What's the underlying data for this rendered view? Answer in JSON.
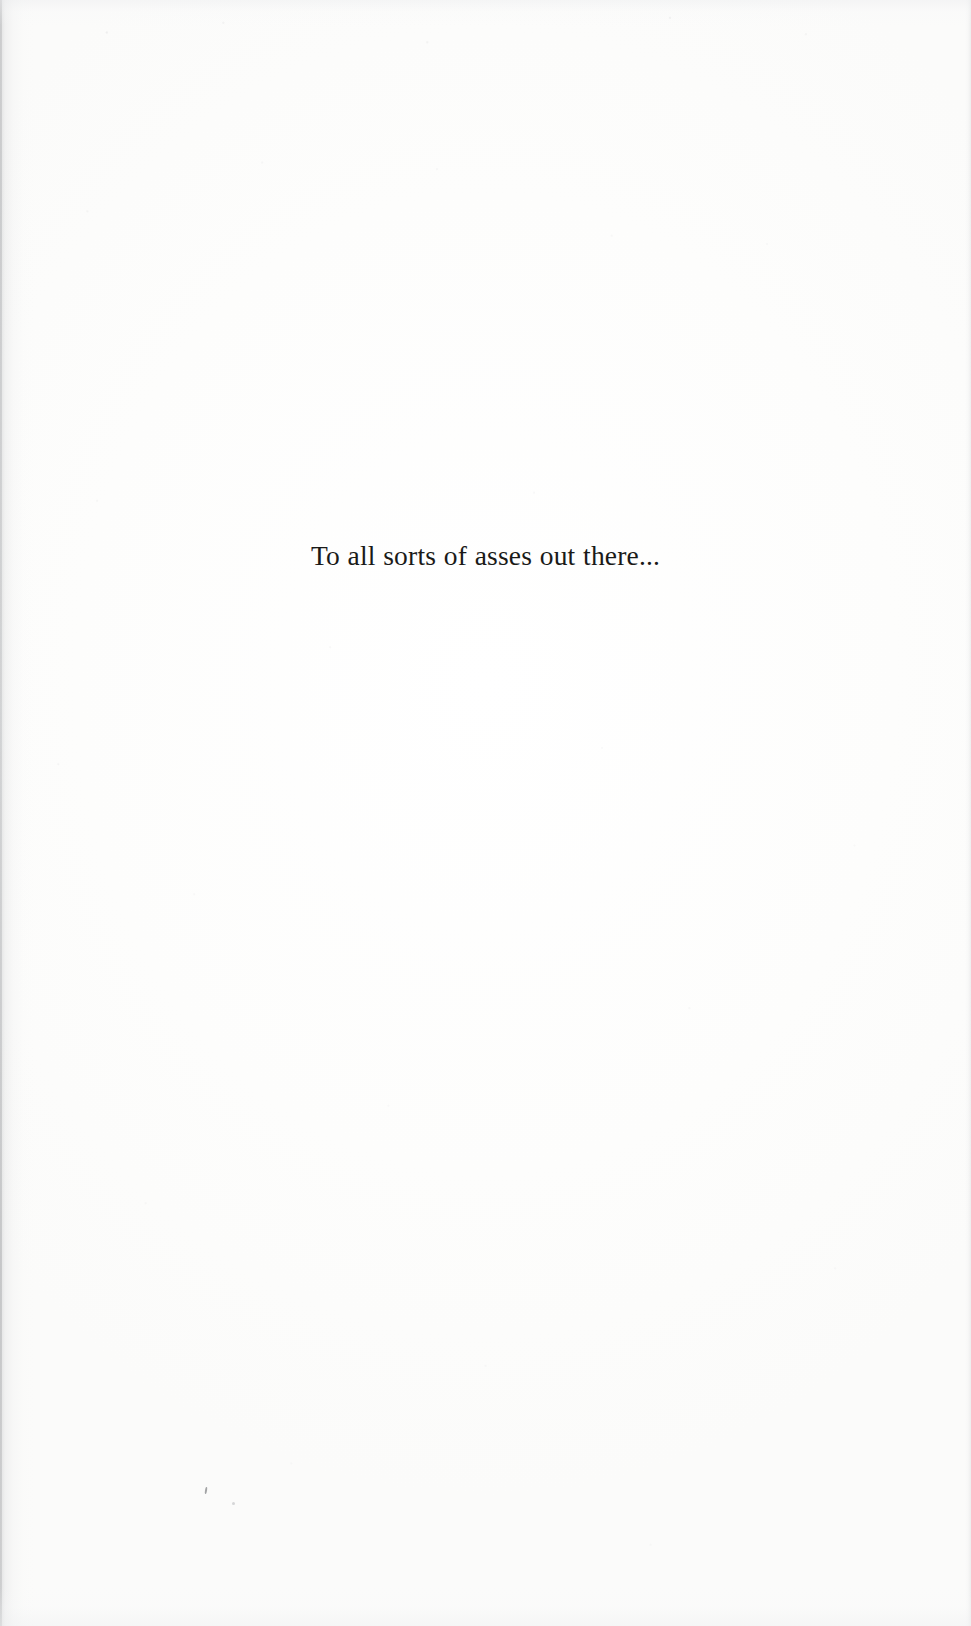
{
  "page": {
    "kind": "book-dedication-page",
    "paper_color": "#fdfdfc",
    "ink_color": "#1a1a18"
  },
  "dedication": {
    "text": "To all sorts of asses out there..."
  }
}
